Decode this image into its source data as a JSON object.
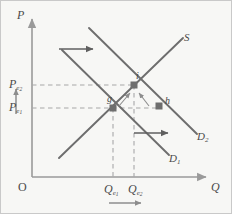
{
  "figure": {
    "kind": "supply-demand-diagram",
    "background_color": "#f7f7f5",
    "border_color": "#c9c9c9",
    "line_color": "#6e6e6e",
    "axis_color": "#9a9a9a",
    "dash_color": "#a8a8a8",
    "marker_color": "#6e6e6e",
    "text_color": "#4a4a4a"
  },
  "axes": {
    "y_label": "P",
    "x_label": "Q",
    "origin_label": "O"
  },
  "price_ticks": [
    {
      "id": "pe2",
      "base": "P",
      "sub": "e",
      "sub2": "2",
      "text": "Pe2"
    },
    {
      "id": "pe1",
      "base": "P",
      "sub": "e",
      "sub2": "1",
      "text": "Pe1"
    }
  ],
  "quantity_ticks": [
    {
      "id": "qe1",
      "base": "Q",
      "sub": "e",
      "sub2": "1",
      "text": "Qe1"
    },
    {
      "id": "qe2",
      "base": "Q",
      "sub": "e",
      "sub2": "2",
      "text": "Qe2"
    }
  ],
  "curves": [
    {
      "id": "supply",
      "label": "S",
      "kind": "supply"
    },
    {
      "id": "demand1",
      "base": "D",
      "sub": "1",
      "label": "D1",
      "kind": "demand"
    },
    {
      "id": "demand2",
      "base": "D",
      "sub": "2",
      "label": "D2",
      "kind": "demand"
    }
  ],
  "points": [
    {
      "id": "g",
      "label": "g",
      "meaning": "initial-equilibrium"
    },
    {
      "id": "i",
      "label": "i",
      "meaning": "new-equilibrium"
    },
    {
      "id": "h",
      "label": "h",
      "meaning": "quantity-demanded-at-old-price"
    }
  ],
  "arrows": [
    {
      "id": "demand-shift-top",
      "direction": "right",
      "meaning": "demand-curve-shifts-right"
    },
    {
      "id": "demand-shift-bottom",
      "direction": "right",
      "meaning": "demand-curve-shifts-right"
    },
    {
      "id": "price-rise",
      "direction": "up",
      "meaning": "price-increases"
    },
    {
      "id": "quantity-rise",
      "direction": "right",
      "meaning": "quantity-increases"
    },
    {
      "id": "adjust-from-g",
      "direction": "up-right",
      "meaning": "movement-along-supply-to-i"
    },
    {
      "id": "adjust-from-h",
      "direction": "up-left",
      "meaning": "movement-along-demand2-to-i"
    }
  ]
}
